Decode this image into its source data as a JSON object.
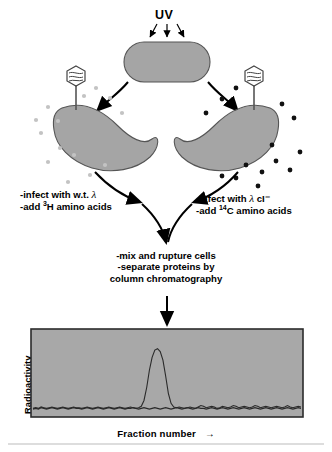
{
  "figure": {
    "uv_label": "UV",
    "left_step": {
      "line1_pre": "-infect with w.t. ",
      "line1_symbol": "λ",
      "line2_pre": "-add ",
      "line2_sup": "3",
      "line2_post": "H amino acids"
    },
    "right_step": {
      "line1_pre": "-infect with ",
      "line1_symbol": "λ",
      "line1_post": " cI⁻",
      "line2_pre": "-add ",
      "line2_sup": "14",
      "line2_post": "C amino acids"
    },
    "middle_step": {
      "line1": "-mix and rupture cells",
      "line2": "-separate proteins by",
      "line3": "column chromatography"
    },
    "icons": {
      "phage_left": "bacteriophage-icon",
      "phage_right": "bacteriophage-icon",
      "uv_arrows": "uv-arrow-icon",
      "flow_arrow": "curved-arrow-icon",
      "down_arrow": "down-arrow-icon"
    },
    "colors": {
      "cell_fill": "#a5a5a5",
      "cell_stroke": "#555555",
      "panel_fill": "#a8a8a8",
      "panel_stroke": "#2b2b2b",
      "trace": "#2a2a2a",
      "dot_light": "#c3c3c3",
      "dot_dark": "#111111",
      "ink": "#000000"
    }
  },
  "chart_data": {
    "type": "line",
    "title": "",
    "xlabel": "Fraction number",
    "ylabel": "Radioactivity",
    "xlabel_suffix": "→",
    "grid": false,
    "legend": null,
    "axis_ticks": [],
    "xlim": [
      0,
      100
    ],
    "ylim": [
      0,
      100
    ],
    "series": [
      {
        "name": "3H-labelled proteins (w.t. lambda)",
        "values": [
          4,
          5,
          4,
          6,
          5,
          4,
          5,
          6,
          5,
          4,
          5,
          6,
          5,
          4,
          5,
          6,
          5,
          5,
          4,
          5,
          6,
          5,
          4,
          5,
          6,
          5,
          4,
          5,
          6,
          5,
          4,
          5,
          6,
          5,
          4,
          5,
          5,
          6,
          5,
          4,
          5,
          6,
          5,
          4,
          5,
          6,
          5,
          4,
          5,
          6,
          5,
          4,
          5,
          6,
          5,
          4,
          5,
          6,
          5,
          4,
          5,
          6,
          5,
          5,
          4,
          5,
          6,
          5,
          4,
          5,
          6,
          5,
          4,
          5,
          6,
          5,
          4,
          5,
          6,
          5,
          4,
          5,
          6,
          5,
          4,
          5,
          6,
          5,
          4,
          5,
          6,
          5,
          4,
          5,
          6,
          5,
          4,
          5,
          6,
          5
        ]
      },
      {
        "name": "14C-labelled proteins (lambda cI-) with repressor peak",
        "values": [
          5,
          6,
          5,
          7,
          6,
          5,
          6,
          7,
          6,
          5,
          6,
          7,
          6,
          5,
          6,
          7,
          6,
          6,
          5,
          6,
          7,
          6,
          5,
          6,
          7,
          6,
          5,
          6,
          7,
          6,
          5,
          6,
          7,
          6,
          5,
          6,
          7,
          6,
          5,
          6,
          8,
          16,
          34,
          58,
          76,
          86,
          88,
          84,
          72,
          50,
          26,
          12,
          7,
          6,
          7,
          6,
          5,
          6,
          7,
          6,
          5,
          7,
          9,
          8,
          6,
          7,
          8,
          7,
          5,
          6,
          8,
          7,
          6,
          7,
          9,
          8,
          6,
          7,
          8,
          7,
          6,
          7,
          9,
          8,
          6,
          7,
          8,
          7,
          6,
          7,
          8,
          7,
          6,
          7,
          9,
          7,
          6,
          7,
          8,
          7
        ]
      }
    ],
    "peak": {
      "center_fraction": 46,
      "height": 88,
      "label": "repressor protein peak"
    }
  }
}
